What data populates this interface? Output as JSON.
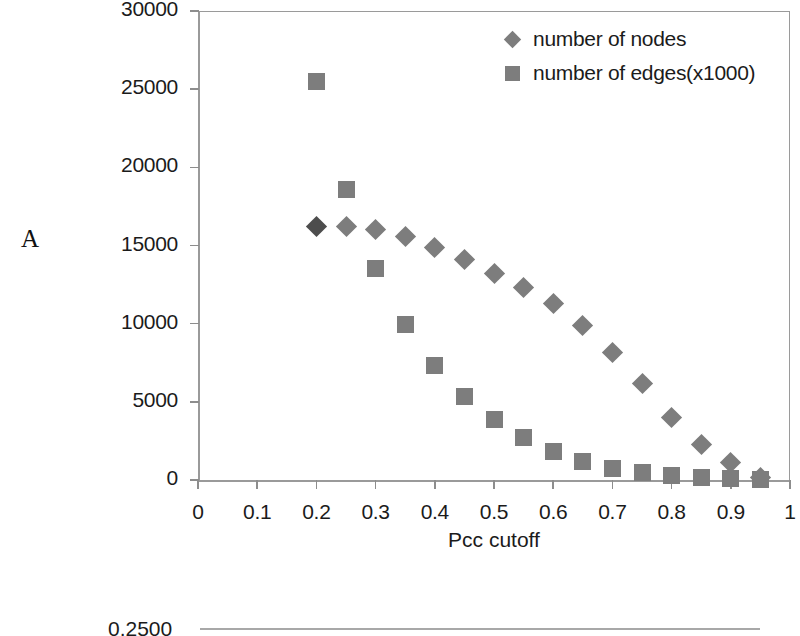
{
  "figure": {
    "panel_label": "A"
  },
  "axes": {
    "x": {
      "label": "Pcc cutoff",
      "ticks": [
        0,
        0.1,
        0.2,
        0.3,
        0.4,
        0.5,
        0.6,
        0.7,
        0.8,
        0.9,
        1
      ],
      "tick_labels": [
        "0",
        "0.1",
        "0.2",
        "0.3",
        "0.4",
        "0.5",
        "0.6",
        "0.7",
        "0.8",
        "0.9",
        "1"
      ],
      "min": 0,
      "max": 1
    },
    "y": {
      "label": "",
      "ticks": [
        0,
        5000,
        10000,
        15000,
        20000,
        25000,
        30000
      ],
      "tick_labels": [
        "0",
        "5000",
        "10000",
        "15000",
        "20000",
        "25000",
        "30000"
      ],
      "min": 0,
      "max": 30000
    }
  },
  "legend": {
    "position": "top-right",
    "items": [
      {
        "label": "number of nodes",
        "marker": "diamond",
        "color": "#7d7d7d"
      },
      {
        "label": "number of edges(x1000)",
        "marker": "square",
        "color": "#7d7d7d"
      }
    ]
  },
  "colors": {
    "marker_gray": "#7d7d7d",
    "marker_dark": "#4d4d4d",
    "axis_gray": "#9a9a9a",
    "text": "#1b1b1b",
    "background": "#ffffff"
  },
  "next_panel_fragment": {
    "tick_label": "0.2500"
  },
  "chart_data": {
    "type": "scatter",
    "title": "",
    "xlabel": "Pcc cutoff",
    "ylabel": "",
    "xlim": [
      0,
      1
    ],
    "ylim": [
      0,
      30000
    ],
    "grid": false,
    "legend_position": "top-right",
    "x": [
      0.2,
      0.25,
      0.3,
      0.35,
      0.4,
      0.45,
      0.5,
      0.55,
      0.6,
      0.65,
      0.7,
      0.75,
      0.8,
      0.85,
      0.9,
      0.95
    ],
    "series": [
      {
        "name": "number of nodes",
        "marker": "diamond",
        "color": "#7d7d7d",
        "values": [
          16200,
          16200,
          16000,
          15550,
          14900,
          14100,
          13200,
          12300,
          11300,
          9900,
          8150,
          6150,
          4000,
          2250,
          1150,
          150
        ]
      },
      {
        "name": "number of edges(x1000)",
        "marker": "square",
        "color": "#7d7d7d",
        "values": [
          25500,
          18600,
          13500,
          9950,
          7350,
          5350,
          3850,
          2700,
          1800,
          1200,
          750,
          500,
          300,
          180,
          80,
          30
        ]
      }
    ]
  }
}
